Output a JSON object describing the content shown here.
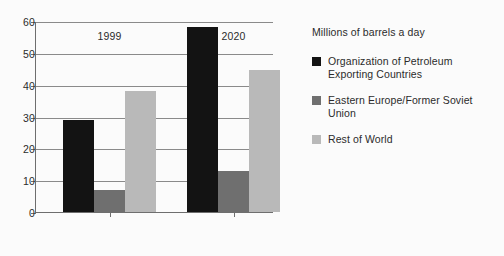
{
  "chart_data": {
    "type": "bar",
    "title": "",
    "legend_title": "Millions of barrels a day",
    "categories": [
      "1999",
      "2020"
    ],
    "series": [
      {
        "name": "Organization of Petroleum Exporting Countries",
        "key": "opec",
        "color": "#131313",
        "values": [
          29,
          58
        ]
      },
      {
        "name": "Eastern Europe/Former Soviet Union",
        "key": "efsu",
        "color": "#6f6f6f",
        "values": [
          7,
          13
        ]
      },
      {
        "name": "Rest of World",
        "key": "rest",
        "color": "#b9b9b9",
        "values": [
          38,
          44.5
        ]
      }
    ],
    "xlabel": "",
    "ylabel": "Millions of barrels a day",
    "ylim": [
      0,
      60
    ],
    "yticks": [
      0,
      10,
      20,
      30,
      40,
      50,
      60
    ],
    "ytick_labels": [
      "0",
      "10",
      "20",
      "30",
      "40",
      "50",
      "60"
    ],
    "grid": true,
    "legend_position": "right"
  },
  "axis": {
    "y_labels": [
      "60",
      "50",
      "40",
      "30",
      "20",
      "10",
      "0"
    ],
    "x_labels": [
      "1999",
      "2020"
    ]
  },
  "legend": {
    "title": "Millions of barrels a day",
    "items": [
      {
        "label": "Organization of Petroleum Exporting Countries",
        "color": "#131313"
      },
      {
        "label": "Eastern Europe/Former Soviet Union",
        "color": "#6f6f6f"
      },
      {
        "label": "Rest of World",
        "color": "#b9b9b9"
      }
    ]
  }
}
